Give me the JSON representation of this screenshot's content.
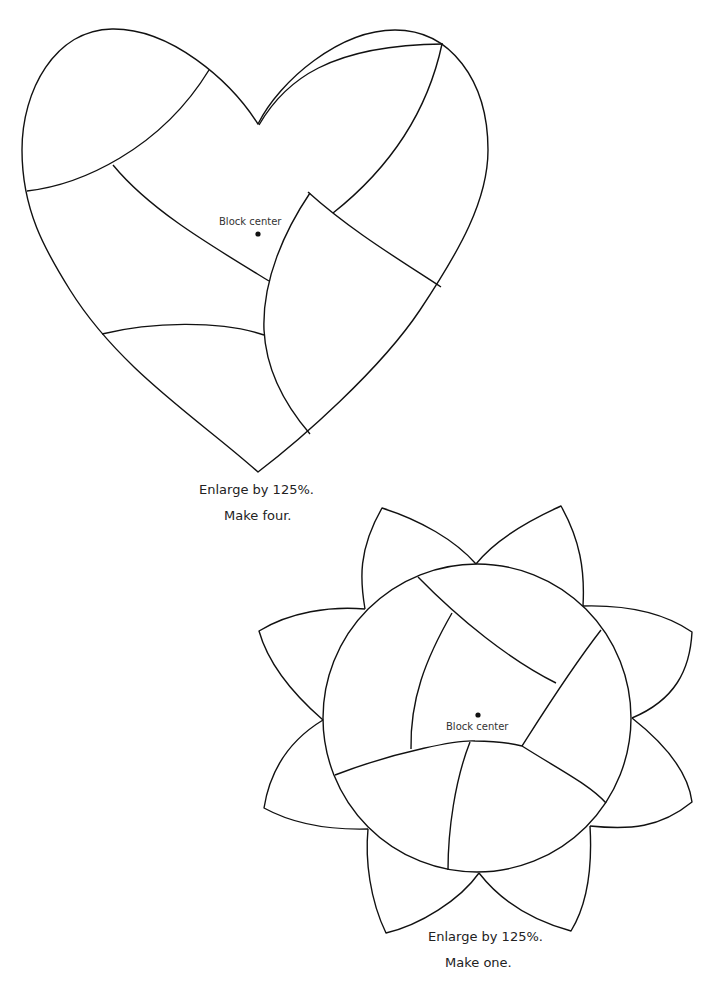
{
  "heart_block": {
    "center_label": "Block center",
    "caption_line1": "Enlarge by 125%.",
    "caption_line2": "Make four."
  },
  "flower_block": {
    "center_label": "Block center",
    "caption_line1": "Enlarge by 125%.",
    "caption_line2": "Make one.",
    "petal_count": 8
  },
  "colors": {
    "line": "#111111",
    "background": "#ffffff"
  }
}
